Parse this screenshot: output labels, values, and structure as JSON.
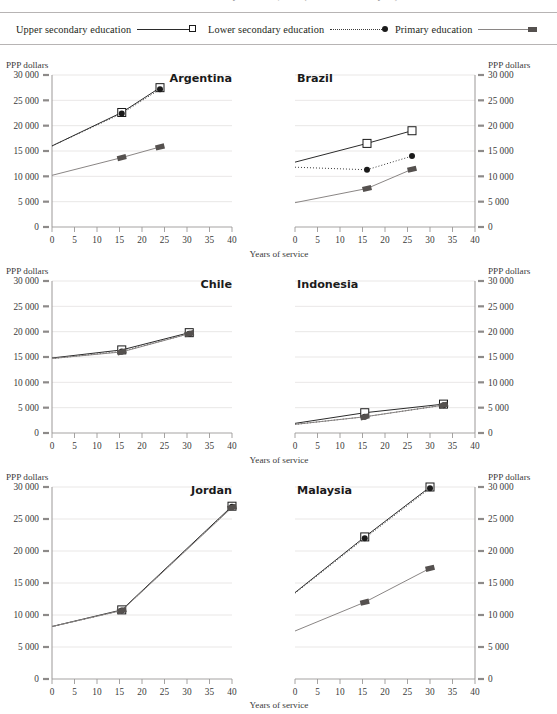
{
  "page": {
    "cut_title": "and lower secondary education, 2015 (or latest available year)",
    "axis_y_label": "PPP dollars",
    "axis_x_label": "Years of service"
  },
  "legend": {
    "items": [
      {
        "label": "Upper secondary education",
        "marker": "open-square-marker",
        "line": "solid"
      },
      {
        "label": "Lower secondary education",
        "marker": "filled-circle-marker",
        "line": "dotted"
      },
      {
        "label": "Primary education",
        "marker": "filled-rectangle-marker",
        "line": "solid"
      }
    ]
  },
  "axes": {
    "xticks": [
      "0",
      "5",
      "10",
      "15",
      "20",
      "25",
      "30",
      "35",
      "40"
    ],
    "yticks": [
      "0",
      "5 000",
      "10 000",
      "15 000",
      "20 000",
      "25 000",
      "30 000"
    ],
    "xlim": [
      0,
      40
    ],
    "ylim": [
      0,
      30000
    ]
  },
  "colors": {
    "upper_secondary": "#2b2b2b",
    "lower_secondary": "#3a3a3a",
    "primary": "#8a8685",
    "grid": "#e3e1e0",
    "axis": "#9b9897",
    "text": "#231f20"
  },
  "chart_data": [
    {
      "type": "line",
      "title": "Argentina",
      "xlabel": "Years of service",
      "ylabel": "PPP dollars",
      "xlim": [
        0,
        40
      ],
      "ylim": [
        0,
        30000
      ],
      "grid": true,
      "series": [
        {
          "name": "Upper secondary education",
          "x": [
            0,
            15.5,
            24
          ],
          "y": [
            16000,
            22600,
            27500
          ]
        },
        {
          "name": "Lower secondary education",
          "x": [
            0,
            15.5,
            24
          ],
          "y": [
            16000,
            22400,
            27200
          ]
        },
        {
          "name": "Primary education",
          "x": [
            0,
            15.5,
            24
          ],
          "y": [
            10200,
            13700,
            15800
          ]
        }
      ]
    },
    {
      "type": "line",
      "title": "Brazil",
      "xlabel": "Years of service",
      "ylabel": "PPP dollars",
      "xlim": [
        0,
        40
      ],
      "ylim": [
        0,
        30000
      ],
      "grid": true,
      "series": [
        {
          "name": "Upper secondary education",
          "x": [
            0,
            16,
            26
          ],
          "y": [
            12800,
            16500,
            19000
          ]
        },
        {
          "name": "Lower secondary education",
          "x": [
            0,
            16,
            26
          ],
          "y": [
            11800,
            11300,
            14000
          ]
        },
        {
          "name": "Primary education",
          "x": [
            0,
            16,
            26
          ],
          "y": [
            4800,
            7600,
            11400
          ]
        }
      ]
    },
    {
      "type": "line",
      "title": "Chile",
      "xlabel": "Years of service",
      "ylabel": "PPP dollars",
      "xlim": [
        0,
        40
      ],
      "ylim": [
        0,
        30000
      ],
      "grid": true,
      "series": [
        {
          "name": "Upper secondary education",
          "x": [
            0,
            15.5,
            30.5
          ],
          "y": [
            14800,
            16400,
            19800
          ]
        },
        {
          "name": "Lower secondary education",
          "x": [
            0,
            15.5,
            30.5
          ],
          "y": [
            14700,
            16100,
            19600
          ]
        },
        {
          "name": "Primary education",
          "x": [
            0,
            15.5,
            30.5
          ],
          "y": [
            14700,
            16000,
            19600
          ]
        }
      ]
    },
    {
      "type": "line",
      "title": "Indonesia",
      "xlabel": "Years of service",
      "ylabel": "PPP dollars",
      "xlim": [
        0,
        40
      ],
      "ylim": [
        0,
        30000
      ],
      "grid": true,
      "series": [
        {
          "name": "Upper secondary education",
          "x": [
            0,
            15.5,
            33
          ],
          "y": [
            1900,
            4000,
            5700
          ]
        },
        {
          "name": "Lower secondary education",
          "x": [
            0,
            15.5,
            33
          ],
          "y": [
            1700,
            3200,
            5500
          ]
        },
        {
          "name": "Primary education",
          "x": [
            0,
            15.5,
            33
          ],
          "y": [
            1700,
            3200,
            5500
          ]
        }
      ]
    },
    {
      "type": "line",
      "title": "Jordan",
      "xlabel": "Years of service",
      "ylabel": "PPP dollars",
      "xlim": [
        0,
        40
      ],
      "ylim": [
        0,
        30000
      ],
      "grid": true,
      "series": [
        {
          "name": "Upper secondary education",
          "x": [
            0,
            15.5,
            40
          ],
          "y": [
            8200,
            10800,
            27000
          ]
        },
        {
          "name": "Lower secondary education",
          "x": [
            0,
            15.5,
            40
          ],
          "y": [
            8200,
            10700,
            26900
          ]
        },
        {
          "name": "Primary education",
          "x": [
            0,
            15.5,
            40
          ],
          "y": [
            8200,
            10700,
            26800
          ]
        }
      ]
    },
    {
      "type": "line",
      "title": "Malaysia",
      "xlabel": "Years of service",
      "ylabel": "PPP dollars",
      "xlim": [
        0,
        40
      ],
      "ylim": [
        0,
        30000
      ],
      "grid": true,
      "series": [
        {
          "name": "Upper secondary education",
          "x": [
            0,
            15.5,
            30
          ],
          "y": [
            13500,
            22200,
            30000
          ]
        },
        {
          "name": "Lower secondary education",
          "x": [
            0,
            15.5,
            30
          ],
          "y": [
            13400,
            22000,
            29800
          ]
        },
        {
          "name": "Primary education",
          "x": [
            0,
            15.5,
            30
          ],
          "y": [
            7500,
            12000,
            17300
          ]
        }
      ]
    }
  ]
}
